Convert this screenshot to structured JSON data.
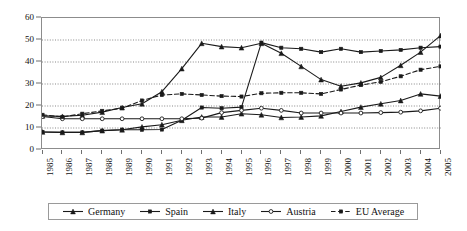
{
  "chart_data": {
    "type": "line",
    "title": "",
    "subtitle": "",
    "xlabel": "",
    "ylabel": "",
    "xlim": [
      1985,
      2005
    ],
    "ylim": [
      0,
      60
    ],
    "yticks": [
      0,
      10,
      20,
      30,
      40,
      50,
      60
    ],
    "grid": true,
    "grid_axis": "y",
    "legend_position": "bottom",
    "categories": [
      "1985",
      "1986",
      "1987",
      "1988",
      "1989",
      "1990",
      "1991",
      "1992",
      "1993",
      "1994",
      "1995",
      "1996",
      "1997",
      "1998",
      "1999",
      "2000",
      "2001",
      "2002",
      "2003",
      "2004",
      "2005"
    ],
    "x": [
      1985,
      1986,
      1987,
      1988,
      1989,
      1990,
      1991,
      1992,
      1993,
      1994,
      1995,
      1996,
      1997,
      1998,
      1999,
      2000,
      2001,
      2002,
      2003,
      2004,
      2005
    ],
    "series": [
      {
        "name": "Germany",
        "marker": "triangle",
        "dash": false,
        "color": "#1a1a1a",
        "values": [
          15.5,
          15.3,
          15.8,
          17.2,
          19.3,
          21.0,
          26.5,
          37.0,
          48.5,
          47.0,
          46.5,
          48.5,
          44.0,
          38.0,
          32.0,
          29.0,
          30.5,
          33.0,
          38.5,
          44.5,
          52.0
        ]
      },
      {
        "name": "Spain",
        "marker": "square",
        "dash": false,
        "color": "#1a1a1a",
        "values": [
          8.2,
          8.0,
          8.0,
          8.8,
          9.2,
          9.2,
          9.3,
          13.5,
          19.3,
          19.0,
          19.5,
          48.8,
          46.5,
          46.0,
          44.5,
          46.0,
          44.5,
          45.0,
          45.5,
          46.5,
          47.0
        ]
      },
      {
        "name": "Italy",
        "marker": "triangle",
        "dash": false,
        "color": "#1a1a1a",
        "values": [
          8.2,
          8.0,
          8.0,
          8.8,
          9.2,
          10.5,
          11.5,
          13.5,
          15.0,
          15.0,
          16.5,
          16.0,
          14.8,
          15.0,
          15.5,
          17.5,
          19.5,
          21.0,
          22.5,
          25.5,
          24.5
        ]
      },
      {
        "name": "Austria",
        "marker": "circle",
        "dash": false,
        "color": "#1a1a1a",
        "values": [
          15.2,
          14.2,
          14.2,
          14.2,
          14.2,
          14.2,
          14.2,
          14.2,
          14.5,
          17.0,
          18.0,
          19.0,
          18.0,
          16.8,
          16.8,
          16.8,
          16.8,
          17.0,
          17.2,
          17.8,
          19.0
        ]
      },
      {
        "name": "EU Average",
        "marker": "square",
        "dash": true,
        "color": "#1a1a1a",
        "values": [
          16.0,
          15.0,
          16.5,
          17.8,
          19.0,
          22.5,
          25.0,
          25.5,
          25.0,
          24.5,
          24.3,
          25.8,
          26.0,
          26.0,
          25.5,
          27.5,
          29.5,
          31.0,
          33.5,
          36.5,
          38.0
        ]
      }
    ]
  },
  "legend": {
    "items": [
      {
        "label": "Germany"
      },
      {
        "label": "Spain"
      },
      {
        "label": "Italy"
      },
      {
        "label": "Austria"
      },
      {
        "label": "EU Average"
      }
    ]
  }
}
